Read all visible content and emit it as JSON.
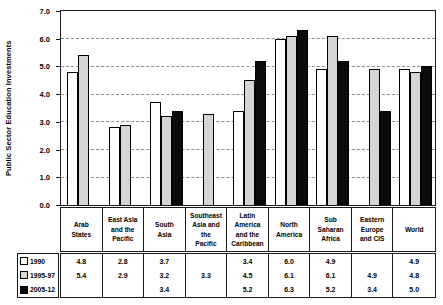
{
  "chart_data": {
    "type": "bar",
    "title": "",
    "ylabel": "Public Sector Education Investments",
    "xlabel": "",
    "ylim": [
      0.0,
      7.0
    ],
    "ytick_labels": [
      "0.0",
      "1.0",
      "2.0",
      "3.0",
      "4.0",
      "5.0",
      "6.0",
      "7.0"
    ],
    "grid": "horizontal-dashed",
    "legend_position": "bottom-left-of-data-table",
    "categories": [
      "Arab\nStates",
      "East Asia\nand the\nPacific",
      "South\nAsia",
      "Southeast\nAsia and\nthe\nPacific",
      "Latin\nAmerica\nand the\nCaribbean",
      "North\nAmerica",
      "Sub\nSaharan\nAfrica",
      "Eastern\nEurope\nand CIS",
      "World"
    ],
    "series": [
      {
        "name": "1990",
        "color": "#ffffff",
        "values": [
          4.8,
          2.8,
          3.7,
          null,
          3.4,
          6.0,
          4.9,
          null,
          4.9
        ]
      },
      {
        "name": "1995-97",
        "color": "#d5d5d5",
        "values": [
          5.4,
          2.9,
          3.2,
          3.3,
          4.5,
          6.1,
          6.1,
          4.9,
          4.8
        ]
      },
      {
        "name": "2005-12",
        "color": "#0b0b0b",
        "values": [
          null,
          null,
          3.4,
          null,
          5.2,
          6.3,
          5.2,
          3.4,
          5.0
        ]
      }
    ],
    "value_format": "one-decimal"
  },
  "colors": {
    "axis_border": "#1a1a1a",
    "gridline": "#8f8f8f",
    "bar_outline": "#000000",
    "background": "#ffffff"
  }
}
